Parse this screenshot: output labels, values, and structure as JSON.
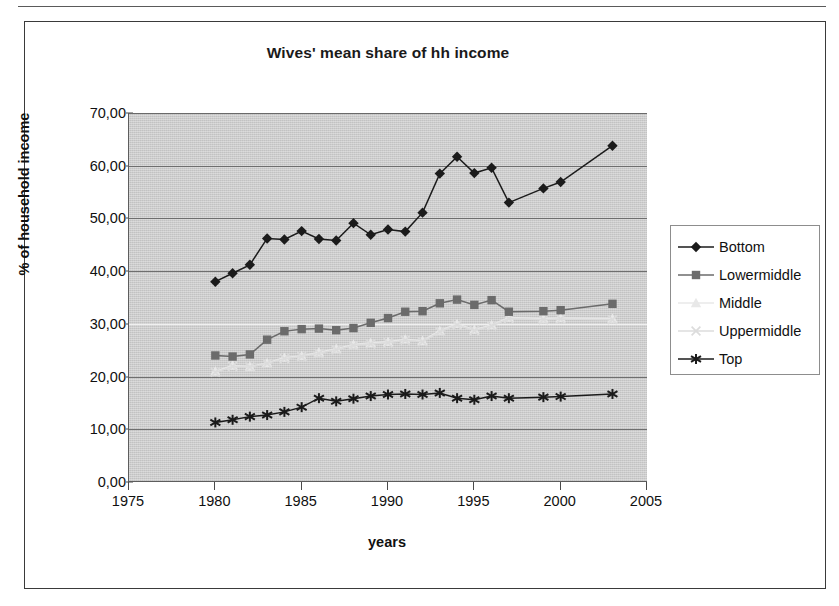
{
  "chart_title": "Wives' mean share of hh income",
  "axes": {
    "y_title": "% of household income",
    "x_title": "years",
    "y_ticks": [
      "0,00",
      "10,00",
      "20,00",
      "30,00",
      "40,00",
      "50,00",
      "60,00",
      "70,00"
    ],
    "x_ticks": [
      "1975",
      "1980",
      "1985",
      "1990",
      "1995",
      "2000",
      "2005"
    ]
  },
  "legend": {
    "items": [
      {
        "label": "Bottom",
        "marker": "diamond-marker-icon",
        "color": "#1b1b1b"
      },
      {
        "label": "Lowermiddle",
        "marker": "square-marker-icon",
        "color": "#6b6b6b"
      },
      {
        "label": "Middle",
        "marker": "triangle-marker-icon",
        "color": "#e8e8e8"
      },
      {
        "label": "Uppermiddle",
        "marker": "x-marker-icon",
        "color": "#dcdcdc"
      },
      {
        "label": "Top",
        "marker": "star-marker-icon",
        "color": "#1b1b1b"
      }
    ]
  },
  "chart_data": {
    "type": "line",
    "title": "Wives' mean share of hh income",
    "xlabel": "years",
    "ylabel": "% of household income",
    "xlim": [
      1975,
      2005
    ],
    "ylim": [
      0,
      70
    ],
    "ytick_step": 10,
    "xtick_step": 5,
    "grid": true,
    "legend_position": "right",
    "decimal_separator": ",",
    "series": [
      {
        "name": "Bottom",
        "color": "#1b1b1b",
        "marker": "diamond",
        "x": [
          1980,
          1981,
          1982,
          1983,
          1984,
          1985,
          1986,
          1987,
          1988,
          1989,
          1990,
          1991,
          1992,
          1993,
          1994,
          1995,
          1996,
          1997,
          1999,
          2000,
          2003
        ],
        "values": [
          38.0,
          39.6,
          41.2,
          46.2,
          46.0,
          47.6,
          46.1,
          45.8,
          49.1,
          46.9,
          47.9,
          47.5,
          51.1,
          58.5,
          61.7,
          58.6,
          59.6,
          53.0,
          55.7,
          56.9,
          63.8
        ]
      },
      {
        "name": "Lowermiddle",
        "color": "#6b6b6b",
        "marker": "square",
        "x": [
          1980,
          1981,
          1982,
          1983,
          1984,
          1985,
          1986,
          1987,
          1988,
          1989,
          1990,
          1991,
          1992,
          1993,
          1994,
          1995,
          1996,
          1997,
          1999,
          2000,
          2003
        ],
        "values": [
          24.0,
          23.8,
          24.2,
          27.0,
          28.6,
          29.0,
          29.1,
          28.8,
          29.2,
          30.2,
          31.1,
          32.3,
          32.4,
          33.9,
          34.6,
          33.6,
          34.5,
          32.3,
          32.4,
          32.6,
          33.8
        ]
      },
      {
        "name": "Middle",
        "color": "#e8e8e8",
        "marker": "triangle",
        "x": [
          1980,
          1981,
          1982,
          1983,
          1984,
          1985,
          1986,
          1987,
          1988,
          1989,
          1990,
          1991,
          1992,
          1993,
          1994,
          1995,
          1996,
          1997,
          1999,
          2000,
          2003
        ],
        "values": [
          21.0,
          22.1,
          21.9,
          22.6,
          23.6,
          23.9,
          24.6,
          25.3,
          26.1,
          26.4,
          26.6,
          27.1,
          26.8,
          28.7,
          30.0,
          28.9,
          29.8,
          31.2,
          31.0,
          31.1,
          31.0
        ]
      },
      {
        "name": "Uppermiddle",
        "color": "#dcdcdc",
        "marker": "x",
        "x": [
          1980,
          1981,
          1982,
          1983,
          1984,
          1985,
          1986,
          1987,
          1988,
          1989,
          1990,
          1991,
          1992,
          1993,
          1994,
          1995,
          1996,
          1997,
          1999,
          2000,
          2003
        ],
        "values": [
          20.8,
          21.9,
          21.8,
          22.5,
          23.4,
          23.8,
          24.4,
          25.1,
          25.9,
          26.2,
          26.4,
          26.9,
          26.6,
          28.5,
          29.8,
          28.7,
          29.6,
          31.0,
          30.8,
          30.9,
          30.8
        ]
      },
      {
        "name": "Top",
        "color": "#1b1b1b",
        "marker": "star",
        "x": [
          1980,
          1981,
          1982,
          1983,
          1984,
          1985,
          1986,
          1987,
          1988,
          1989,
          1990,
          1991,
          1992,
          1993,
          1994,
          1995,
          1996,
          1997,
          1999,
          2000,
          2003
        ],
        "values": [
          11.3,
          11.8,
          12.4,
          12.7,
          13.3,
          14.2,
          15.9,
          15.3,
          15.8,
          16.3,
          16.6,
          16.7,
          16.6,
          16.9,
          15.9,
          15.6,
          16.3,
          15.9,
          16.1,
          16.2,
          16.7
        ]
      }
    ]
  }
}
